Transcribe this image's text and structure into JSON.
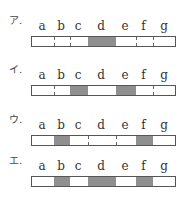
{
  "letters": [
    "a",
    "b",
    "c",
    "d",
    "e",
    "f",
    "g"
  ],
  "segments_px": [
    [
      0,
      22
    ],
    [
      22,
      38
    ],
    [
      38,
      56
    ],
    [
      56,
      84
    ],
    [
      84,
      104
    ],
    [
      104,
      121
    ],
    [
      121,
      145
    ]
  ],
  "options": [
    {
      "label": "ア.",
      "shaded": [
        "d"
      ]
    },
    {
      "label": "イ.",
      "shaded": [
        "c",
        "e"
      ]
    },
    {
      "label": "ウ.",
      "shaded": [
        "b",
        "f"
      ]
    },
    {
      "label": "エ.",
      "shaded": [
        "b",
        "d",
        "f"
      ]
    }
  ],
  "colors": {
    "shade": "#8f8f8f",
    "border": "#555555"
  }
}
